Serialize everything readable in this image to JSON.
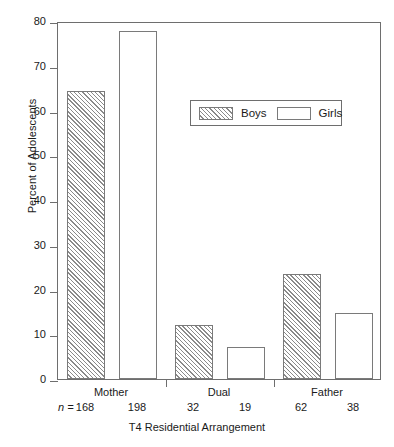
{
  "chart_data": {
    "type": "bar",
    "title": "",
    "xlabel": "T4 Residential Arrangement",
    "ylabel": "Percent of Adolescents",
    "categories": [
      "Mother",
      "Dual",
      "Father"
    ],
    "ylim": [
      0,
      80
    ],
    "yticks": [
      0,
      10,
      20,
      30,
      40,
      50,
      60,
      70,
      80
    ],
    "ytick_labels": [
      "0",
      "10",
      "20",
      "30",
      "40",
      "50",
      "60",
      "70",
      "80"
    ],
    "grid": false,
    "legend_position": "upper center",
    "series": [
      {
        "name": "Boys",
        "style": "hatched",
        "values": [
          64.3,
          12.0,
          23.5
        ],
        "n": [
          168,
          32,
          62
        ]
      },
      {
        "name": "Girls",
        "style": "open",
        "values": [
          77.8,
          7.2,
          14.8
        ],
        "n": [
          198,
          19,
          38
        ]
      }
    ],
    "n_prefix": "n ="
  },
  "legend": {
    "boys_label": "Boys",
    "girls_label": "Girls"
  }
}
